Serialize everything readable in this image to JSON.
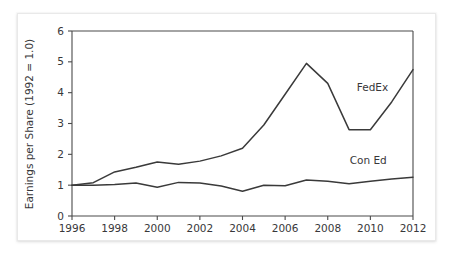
{
  "chart_data": {
    "type": "line",
    "title": "",
    "xlabel": "",
    "ylabel": "Earnings per Share (1992 = 1.0)",
    "xlim": [
      1996,
      2012
    ],
    "ylim": [
      0,
      6
    ],
    "grid": false,
    "legend_position": "inline-right",
    "x_ticks": [
      "1996",
      "1998",
      "2000",
      "2002",
      "2004",
      "2006",
      "2008",
      "2010",
      "2012"
    ],
    "x_tick_values": [
      1996,
      1998,
      2000,
      2002,
      2004,
      2006,
      2008,
      2010,
      2012
    ],
    "y_ticks": [
      "0",
      "1",
      "2",
      "3",
      "4",
      "5",
      "6"
    ],
    "y_tick_values": [
      0,
      1,
      2,
      3,
      4,
      5,
      6
    ],
    "x": [
      1996,
      1997,
      1998,
      1999,
      2000,
      2001,
      2002,
      2003,
      2004,
      2005,
      2006,
      2007,
      2008,
      2009,
      2010,
      2011,
      2012
    ],
    "series": [
      {
        "name": "FedEx",
        "label": "FedEx",
        "color": "#3a3a3a",
        "values": [
          1.0,
          1.08,
          1.43,
          1.58,
          1.75,
          1.68,
          1.78,
          1.95,
          2.2,
          2.95,
          3.95,
          4.95,
          4.3,
          2.8,
          2.8,
          3.7,
          4.75
        ],
        "label_x": 2010.1,
        "label_y": 4.05
      },
      {
        "name": "Con Ed",
        "label": "Con Ed",
        "color": "#3a3a3a",
        "values": [
          1.0,
          1.0,
          1.02,
          1.07,
          0.93,
          1.09,
          1.07,
          0.97,
          0.8,
          1.0,
          0.98,
          1.17,
          1.13,
          1.05,
          1.13,
          1.2,
          1.26
        ],
        "label_x": 2009.9,
        "label_y": 1.68
      }
    ]
  }
}
